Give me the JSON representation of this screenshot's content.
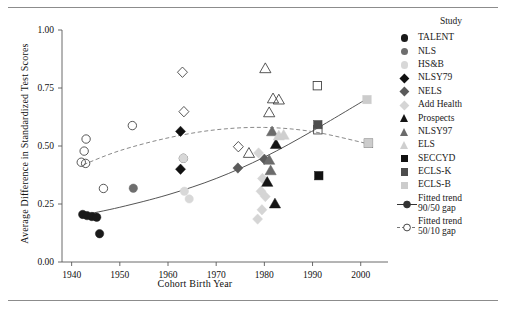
{
  "chart_data": {
    "type": "scatter",
    "title": "",
    "xlabel": "Cohort Birth Year",
    "ylabel": "Average Difference in Standardized Test Scores",
    "xlim": [
      1938,
      2004
    ],
    "ylim": [
      0.0,
      1.0
    ],
    "xticks": [
      1940,
      1950,
      1960,
      1970,
      1980,
      1990,
      2000
    ],
    "xtick_labels": [
      "1940",
      "1950",
      "1960",
      "1970",
      "1980",
      "1990",
      "2000"
    ],
    "yticks": [
      0.0,
      0.25,
      0.5,
      0.75,
      1.0
    ],
    "ytick_labels": [
      "0.00",
      "0.25",
      "0.50",
      "0.75",
      "1.00"
    ],
    "grid": false,
    "legend_position": "right",
    "legend_title": "Study",
    "series": [
      {
        "name": "TALENT",
        "marker": "circle",
        "fill": "#1a1a1a",
        "stroke": "#1a1a1a",
        "points": [
          [
            1942.3,
            0.205
          ],
          [
            1943.2,
            0.2
          ],
          [
            1944.2,
            0.196
          ],
          [
            1945.2,
            0.193
          ],
          [
            1945.8,
            0.122
          ]
        ]
      },
      {
        "name": "NLS",
        "marker": "circle",
        "fill": "#6e6e6e",
        "stroke": "#6e6e6e",
        "points": [
          [
            1952.8,
            0.318
          ]
        ]
      },
      {
        "name": "HS&B",
        "marker": "circle",
        "fill": "#d8d8d8",
        "stroke": "#d8d8d8",
        "points": [
          [
            1963.2,
            0.447
          ],
          [
            1963.4,
            0.305
          ],
          [
            1964.4,
            0.272
          ]
        ]
      },
      {
        "name": "NLSY79",
        "marker": "diamond",
        "fill": "#111111",
        "stroke": "#111111",
        "points": [
          [
            1962.6,
            0.563
          ],
          [
            1962.6,
            0.4
          ]
        ]
      },
      {
        "name": "NELS",
        "marker": "diamond",
        "fill": "#5a5a5a",
        "stroke": "#5a5a5a",
        "points": [
          [
            1974.5,
            0.405
          ],
          [
            1980.0,
            0.443
          ]
        ]
      },
      {
        "name": "Add Health",
        "marker": "diamond",
        "fill": "#d5d5d5",
        "stroke": "#d5d5d5",
        "points": [
          [
            1978.8,
            0.47
          ],
          [
            1979.6,
            0.36
          ],
          [
            1979.3,
            0.305
          ],
          [
            1980.2,
            0.282
          ],
          [
            1979.5,
            0.225
          ],
          [
            1978.6,
            0.185
          ]
        ]
      },
      {
        "name": "Prospects",
        "marker": "triangle",
        "fill": "#141414",
        "stroke": "#141414",
        "points": [
          [
            1982.4,
            0.508
          ],
          [
            1980.6,
            0.345
          ],
          [
            1982.2,
            0.252
          ]
        ]
      },
      {
        "name": "NLSY97",
        "marker": "triangle",
        "fill": "#6b6b6b",
        "stroke": "#6b6b6b",
        "points": [
          [
            1981.6,
            0.563
          ],
          [
            1981.0,
            0.44
          ],
          [
            1981.3,
            0.395
          ]
        ]
      },
      {
        "name": "ELS",
        "marker": "triangle",
        "fill": "#cfcfcf",
        "stroke": "#cfcfcf",
        "points": [
          [
            1983.0,
            0.545
          ],
          [
            1984.0,
            0.548
          ]
        ]
      },
      {
        "name": "SECCYD",
        "marker": "square",
        "fill": "#111111",
        "stroke": "#111111",
        "points": [
          [
            1991.3,
            0.372
          ]
        ]
      },
      {
        "name": "ECLS-K",
        "marker": "square",
        "fill": "#4d4d4d",
        "stroke": "#4d4d4d",
        "points": [
          [
            1991.1,
            0.592
          ]
        ]
      },
      {
        "name": "ECLS-B",
        "marker": "square",
        "fill": "#cccccc",
        "stroke": "#cccccc",
        "points": [
          [
            2001.3,
            0.7
          ],
          [
            2001.6,
            0.512
          ]
        ]
      }
    ],
    "open_markers_note": "Open (unfilled) markers denote the 50/10 gap observations; filled markers denote the 90/50 gap.",
    "open_series": [
      {
        "name": "TALENT 50/10",
        "marker": "circle",
        "points": [
          [
            1943.0,
            0.53
          ],
          [
            1942.6,
            0.478
          ],
          [
            1942.0,
            0.43
          ],
          [
            1942.9,
            0.425
          ],
          [
            1946.6,
            0.317
          ]
        ]
      },
      {
        "name": "NLS 50/10",
        "marker": "circle",
        "points": [
          [
            1952.6,
            0.588
          ]
        ]
      },
      {
        "name": "HS&B 50/10",
        "marker": "circle",
        "points": [
          [
            1963.2,
            0.447
          ]
        ]
      },
      {
        "name": "NLSY79 50/10",
        "marker": "diamond",
        "points": [
          [
            1963.0,
            0.818
          ],
          [
            1963.3,
            0.648
          ]
        ]
      },
      {
        "name": "NELS 50/10",
        "marker": "diamond",
        "points": [
          [
            1974.6,
            0.497
          ]
        ]
      },
      {
        "name": "Prospects 50/10",
        "marker": "triangle",
        "points": [
          [
            1980.2,
            0.835
          ],
          [
            1981.8,
            0.705
          ],
          [
            1983.0,
            0.7
          ],
          [
            1981.0,
            0.645
          ],
          [
            1976.8,
            0.47
          ]
        ]
      },
      {
        "name": "SECCYD 50/10",
        "marker": "square",
        "points": [
          [
            1991.0,
            0.76
          ],
          [
            1991.1,
            0.57
          ]
        ]
      },
      {
        "name": "ECLS-B 50/10",
        "marker": "square",
        "points": [
          [
            2001.6,
            0.512
          ]
        ]
      }
    ],
    "trends": [
      {
        "name": "Fitted trend 90/50 gap",
        "style": "solid",
        "color": "#555555",
        "points": [
          [
            1942.5,
            0.203
          ],
          [
            1950,
            0.236
          ],
          [
            1960,
            0.29
          ],
          [
            1970,
            0.36
          ],
          [
            1980,
            0.452
          ],
          [
            1990,
            0.565
          ],
          [
            2001,
            0.7
          ]
        ]
      },
      {
        "name": "Fitted trend 50/10 gap",
        "style": "dashed",
        "color": "#8a8a8a",
        "points": [
          [
            1942.5,
            0.42
          ],
          [
            1950,
            0.48
          ],
          [
            1960,
            0.535
          ],
          [
            1970,
            0.57
          ],
          [
            1980,
            0.58
          ],
          [
            1990,
            0.562
          ],
          [
            2001,
            0.512
          ]
        ]
      }
    ]
  },
  "axes": {
    "xlabel": "Cohort Birth Year",
    "ylabel": "Average Difference in Standardized Test Scores",
    "xticks": [
      "1940",
      "1950",
      "1960",
      "1970",
      "1980",
      "1990",
      "2000"
    ],
    "yticks": [
      "1.00",
      "0.75",
      "0.50",
      "0.25",
      "0.00"
    ]
  },
  "legend": {
    "title": "Study",
    "items": [
      {
        "label": "TALENT",
        "shape": "circle",
        "color": "#1a1a1a"
      },
      {
        "label": "NLS",
        "shape": "circle",
        "color": "#6e6e6e"
      },
      {
        "label": "HS&B",
        "shape": "circle",
        "color": "#d8d8d8"
      },
      {
        "label": "NLSY79",
        "shape": "diamond",
        "color": "#111111"
      },
      {
        "label": "NELS",
        "shape": "diamond",
        "color": "#5a5a5a"
      },
      {
        "label": "Add Health",
        "shape": "diamond",
        "color": "#d5d5d5"
      },
      {
        "label": "Prospects",
        "shape": "triangle",
        "color": "#141414"
      },
      {
        "label": "NLSY97",
        "shape": "triangle",
        "color": "#6b6b6b"
      },
      {
        "label": "ELS",
        "shape": "triangle",
        "color": "#cfcfcf"
      },
      {
        "label": "SECCYD",
        "shape": "square",
        "color": "#111111"
      },
      {
        "label": "ECLS-K",
        "shape": "square",
        "color": "#4d4d4d"
      },
      {
        "label": "ECLS-B",
        "shape": "square",
        "color": "#cccccc"
      }
    ],
    "trend_items": [
      {
        "label_line1": "Fitted trend",
        "label_line2": "90/50 gap",
        "style": "solid",
        "color": "#333333"
      },
      {
        "label_line1": "Fitted trend",
        "label_line2": "50/10 gap",
        "style": "dashed",
        "color": "#777777"
      }
    ]
  }
}
